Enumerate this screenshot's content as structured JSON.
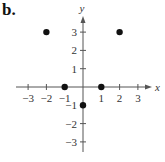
{
  "panel_label": "b.",
  "chart_data": {
    "type": "scatter",
    "title": "",
    "xlabel": "x",
    "ylabel": "y",
    "xlim": [
      -3,
      3
    ],
    "ylim": [
      -3,
      3
    ],
    "grid": false,
    "x_ticks": [
      -3,
      -2,
      -1,
      1,
      2,
      3
    ],
    "y_ticks": [
      3,
      2,
      1,
      -1,
      -2,
      -3
    ],
    "x_tick_labels": [
      "−3",
      "−2",
      "−1",
      "1",
      "2",
      "3"
    ],
    "y_tick_labels": [
      "3",
      "2",
      "1",
      "−1",
      "−2",
      "−3"
    ],
    "points": [
      {
        "x": -2,
        "y": 3
      },
      {
        "x": 2,
        "y": 3
      },
      {
        "x": -1,
        "y": 0
      },
      {
        "x": 1,
        "y": 0
      },
      {
        "x": 0,
        "y": -1
      }
    ],
    "colors": {
      "axis": "#555555",
      "point": "#111111"
    }
  }
}
